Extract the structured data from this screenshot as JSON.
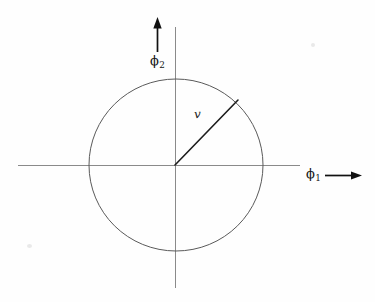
{
  "figure": {
    "background_color": "#fefefe",
    "axis_color": "#8a8a8a",
    "circle_color": "#5a5a5a",
    "vector_color": "#1c1c1c",
    "arrow_color": "#111111"
  },
  "labels": {
    "horizontal_axis": {
      "symbol": "ϕ",
      "subscript": "1"
    },
    "vertical_axis": {
      "symbol": "ϕ",
      "subscript": "2"
    },
    "vector": "v"
  },
  "chart_data": {
    "type": "scatter",
    "title": "",
    "xlabel": "ϕ1",
    "ylabel": "ϕ2",
    "grid": false,
    "legend": "none",
    "xlim": [
      -1.8,
      1.45
    ],
    "ylim": [
      -1.6,
      1.6
    ],
    "origin_px": {
      "x": 175,
      "y": 165
    },
    "circle": {
      "center": [
        0,
        0
      ],
      "radius": 1,
      "radius_px": 87,
      "stroke": "#5a5a5a"
    },
    "vector": {
      "label": "v",
      "from": [
        0,
        0
      ],
      "to": [
        0.72,
        0.69
      ],
      "angle_deg": 45,
      "length": 1,
      "tip_px": {
        "x": 238,
        "y": 100
      },
      "label_px": {
        "x": 200,
        "y": 116
      }
    },
    "axes": {
      "horizontal": {
        "from_px": 18,
        "to_px": 300,
        "y_px": 165
      },
      "vertical": {
        "from_px": 27,
        "to_px": 288,
        "x_px": 175
      }
    },
    "arrows": [
      {
        "name": "phi2-direction-arrow",
        "direction": "up",
        "x_px": 157,
        "from_y_px": 52,
        "to_y_px": 18
      },
      {
        "name": "phi1-direction-arrow",
        "direction": "right",
        "y_px": 175,
        "from_x_px": 325,
        "to_x_px": 361
      }
    ]
  }
}
